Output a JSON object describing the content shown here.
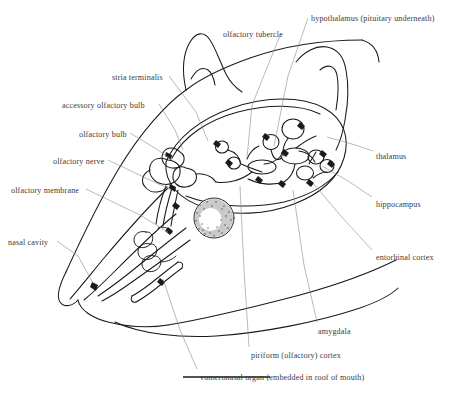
{
  "figure": {
    "ink_color": "#1a1a1a",
    "leader_color": "#8d8a86",
    "text_color": "#3c3a38",
    "background_color": "#ffffff",
    "scale_bar": {
      "name": "scale-bar",
      "x1": 183,
      "y1": 377,
      "x2": 270,
      "y2": 377
    }
  },
  "labels": [
    {
      "id": "olfactory-tubercle",
      "text": "olfactory tubercle",
      "x": 223,
      "y": 30,
      "align": "left",
      "leader": [
        [
          281,
          33
        ],
        [
          252,
          105
        ],
        [
          247,
          158
        ]
      ]
    },
    {
      "id": "hypothalamus",
      "text": "hypothalamus (pituitary underneath)",
      "x": 311,
      "y": 14,
      "align": "left",
      "leader": [
        [
          308,
          18
        ],
        [
          288,
          76
        ],
        [
          274,
          146
        ]
      ]
    },
    {
      "id": "stria-terminalis",
      "text": "stria terminalis",
      "x": 112,
      "y": 73,
      "align": "left",
      "leader": [
        [
          169,
          76
        ],
        [
          196,
          112
        ],
        [
          208,
          141
        ]
      ]
    },
    {
      "id": "accessory-olfactory-bulb",
      "text": "accessory olfactory bulb",
      "x": 62,
      "y": 101,
      "align": "left",
      "leader": [
        [
          159,
          104
        ],
        [
          175,
          130
        ],
        [
          183,
          150
        ]
      ]
    },
    {
      "id": "olfactory-bulb",
      "text": "olfactory bulb",
      "x": 79,
      "y": 130,
      "align": "left",
      "leader": [
        [
          130,
          133
        ],
        [
          158,
          150
        ],
        [
          172,
          160
        ]
      ]
    },
    {
      "id": "olfactory-nerve",
      "text": "olfactory nerve",
      "x": 53,
      "y": 157,
      "align": "left",
      "leader": [
        [
          108,
          160
        ],
        [
          150,
          180
        ],
        [
          171,
          190
        ]
      ]
    },
    {
      "id": "olfactory-membrane",
      "text": "olfactory membrane",
      "x": 11,
      "y": 186,
      "align": "left",
      "leader": [
        [
          86,
          189
        ],
        [
          140,
          215
        ],
        [
          168,
          232
        ]
      ]
    },
    {
      "id": "nasal-cavity",
      "text": "nasal cavity",
      "x": 8,
      "y": 238,
      "align": "left",
      "leader": [
        [
          57,
          241
        ],
        [
          78,
          256
        ],
        [
          93,
          283
        ]
      ]
    },
    {
      "id": "thalamus",
      "text": "thalamus",
      "x": 376,
      "y": 152,
      "align": "left",
      "leader": [
        [
          373,
          151
        ],
        [
          352,
          144
        ],
        [
          327,
          137
        ]
      ]
    },
    {
      "id": "hippocampus",
      "text": "hippocampus",
      "x": 376,
      "y": 200,
      "align": "left",
      "leader": [
        [
          372,
          197
        ],
        [
          348,
          181
        ],
        [
          322,
          166
        ]
      ]
    },
    {
      "id": "entorhinal-cortex",
      "text": "entorhinal cortex",
      "x": 376,
      "y": 253,
      "align": "left",
      "leader": [
        [
          372,
          250
        ],
        [
          340,
          215
        ],
        [
          313,
          183
        ]
      ]
    },
    {
      "id": "amygdala",
      "text": "amygdala",
      "x": 318,
      "y": 327,
      "align": "left",
      "leader": [
        [
          317,
          322
        ],
        [
          304,
          265
        ],
        [
          293,
          190
        ]
      ]
    },
    {
      "id": "piriform-cortex",
      "text": "piriform (olfactory) cortex",
      "x": 251,
      "y": 351,
      "align": "left",
      "leader": [
        [
          249,
          347
        ],
        [
          244,
          270
        ],
        [
          240,
          186
        ]
      ]
    },
    {
      "id": "vomeronasal-organ",
      "text": "vomeronasal organ (embedded in roof of mouth)",
      "x": 200,
      "y": 373,
      "align": "left",
      "leader": [
        [
          197,
          369
        ],
        [
          180,
          330
        ],
        [
          163,
          279
        ]
      ]
    }
  ],
  "anatomy": {
    "eye": {
      "name": "eye",
      "cx": 214,
      "cy": 218,
      "r": 20
    },
    "regions": [
      "olfactory bulb",
      "accessory olfactory bulb",
      "olfactory tubercle",
      "piriform cortex",
      "amygdala",
      "thalamus",
      "hypothalamus",
      "hippocampus",
      "entorhinal cortex",
      "stria terminalis",
      "vomeronasal organ",
      "nasal cavity",
      "olfactory membrane",
      "olfactory nerve"
    ]
  }
}
